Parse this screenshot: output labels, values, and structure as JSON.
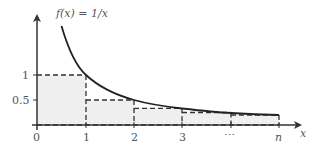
{
  "diagram": {
    "title": "f(x) = 1/x",
    "function_label": "f(x) = 1/x",
    "x_axis_label": "x",
    "x_ticks": [
      "0",
      "1",
      "2",
      "3",
      "⋯",
      "n"
    ],
    "y_ticks": [
      "1",
      "0.5"
    ],
    "rectangles": [
      {
        "from": "0",
        "to": "1",
        "height": 1
      },
      {
        "from": "1",
        "to": "2",
        "height": 0.5
      },
      {
        "from": "2",
        "to": "3",
        "height": 0.3333
      },
      {
        "from": "3",
        "to": "⋯",
        "height": 0.25
      },
      {
        "from": "⋯",
        "to": "n",
        "height": 0.2
      }
    ],
    "colors": {
      "axis": "#333333",
      "curve": "#222222",
      "fill": "#efefef",
      "dash": "#333333",
      "label": "#555555"
    }
  }
}
